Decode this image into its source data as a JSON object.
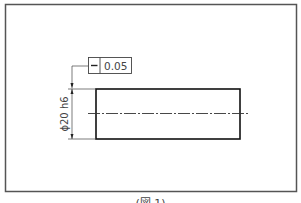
{
  "drawing": {
    "tolerance_frame": {
      "symbol": "straightness",
      "symbol_glyph": "—",
      "value": "0.05"
    },
    "dimension": {
      "label": "ϕ20 h6"
    },
    "caption": "(図 1)"
  }
}
